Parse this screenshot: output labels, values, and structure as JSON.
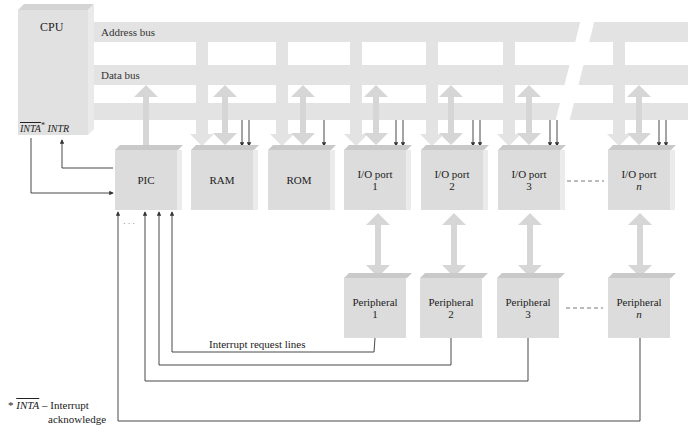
{
  "figure": {
    "cpu": {
      "label": "CPU",
      "inta_label": "INTA",
      "inta_star": "*",
      "intr_label": "INTR"
    },
    "buses": {
      "address": "Address bus",
      "data": "Data bus"
    },
    "blocks": [
      {
        "id": "pic",
        "label": "PIC",
        "sub": ""
      },
      {
        "id": "ram",
        "label": "RAM",
        "sub": ""
      },
      {
        "id": "rom",
        "label": "ROM",
        "sub": ""
      },
      {
        "id": "io1",
        "label": "I/O port",
        "sub": "1"
      },
      {
        "id": "io2",
        "label": "I/O port",
        "sub": "2"
      },
      {
        "id": "io3",
        "label": "I/O port",
        "sub": "3"
      },
      {
        "id": "ion",
        "label": "I/O port",
        "sub": "n"
      }
    ],
    "peripherals": [
      {
        "label": "Peripheral",
        "sub": "1"
      },
      {
        "label": "Peripheral",
        "sub": "2"
      },
      {
        "label": "Peripheral",
        "sub": "3"
      },
      {
        "label": "Peripheral",
        "sub": "n"
      }
    ],
    "ellipsis": "· · ·",
    "interrupt_lines_label": "Interrupt request lines",
    "footnote": {
      "star": "*",
      "inta": "INTA",
      "dash": " – Interrupt",
      "line2": "acknowledge"
    }
  },
  "colors": {
    "bus": "#e3e3e3",
    "block": "#dcdcdc",
    "block_top": "#c9c9c9",
    "line": "#333333"
  }
}
